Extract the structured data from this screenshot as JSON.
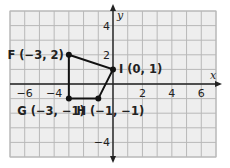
{
  "diagram": {
    "type": "coordinate-plane-polygon",
    "colors": {
      "grid_bg": "#eeeeee",
      "grid_line": "#b8b8b8",
      "axis": "#222222",
      "polygon": "#111111"
    },
    "axes": {
      "x_label": "x",
      "y_label": "y",
      "x_range": [
        -7,
        7
      ],
      "y_range": [
        -5,
        5
      ],
      "x_ticks": [
        {
          "value": -6,
          "label": "−6"
        },
        {
          "value": -4,
          "label": "−4"
        },
        {
          "value": 2,
          "label": "2"
        },
        {
          "value": 4,
          "label": "4"
        },
        {
          "value": 6,
          "label": "6"
        }
      ],
      "y_ticks": [
        {
          "value": 4,
          "label": "4"
        },
        {
          "value": 2,
          "label": "2"
        },
        {
          "value": -4,
          "label": "−4"
        }
      ]
    },
    "points": [
      {
        "name": "F",
        "x": -3,
        "y": 2,
        "label": "F (−3, 2)"
      },
      {
        "name": "I",
        "x": 0,
        "y": 1,
        "label": "I (0, 1)"
      },
      {
        "name": "H",
        "x": -1,
        "y": -1,
        "label": "H (−1, −1)"
      },
      {
        "name": "G",
        "x": -3,
        "y": -1,
        "label": "G (−3, −1)"
      }
    ]
  }
}
